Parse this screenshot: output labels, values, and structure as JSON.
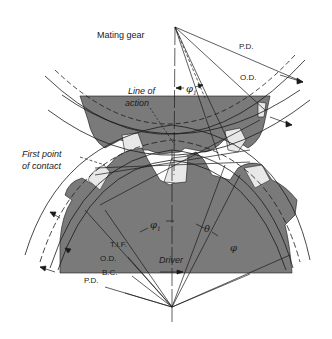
{
  "diagram": {
    "type": "gear-mesh-geometry",
    "colors": {
      "gear_fill": "#7a7a7a",
      "tooth_highlight": "#e8e8e8",
      "line": "#1a1a1a",
      "background": "#ffffff"
    },
    "labels": {
      "mating_gear": "Mating gear",
      "top_pd": "P.D.",
      "top_od": "O.D.",
      "line_of_action_1": "Line of",
      "line_of_action_2": "action",
      "phi1_top": "φ",
      "phi1_top_sub": "1",
      "first_point_1": "First point",
      "first_point_2": "of contact",
      "phi1_bottom": "φ",
      "phi1_bottom_sub": "1",
      "theta": "θ",
      "phi": "φ",
      "tif": "T.I.F.",
      "bottom_od": "O.D.",
      "bc": "B.C.",
      "bottom_pd": "P.D.",
      "driver": "Driver"
    },
    "components": [
      {
        "name": "Mating gear",
        "position": "top",
        "role": "driven"
      },
      {
        "name": "Driver",
        "position": "bottom",
        "role": "driving"
      }
    ],
    "circles": [
      "P.D.",
      "O.D.",
      "B.C.",
      "T.I.F."
    ],
    "angles": [
      "φ1",
      "θ",
      "φ"
    ]
  }
}
